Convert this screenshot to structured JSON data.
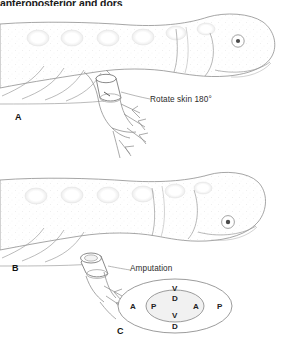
{
  "figure": {
    "header_text": "anteroposterior and dors",
    "line_color": "#8a8a8a",
    "text_color": "#2b2b2b",
    "fill_color": "#ffffff",
    "stipple_color": "#d9d9d9"
  },
  "panels": [
    {
      "id": "A",
      "label": "A",
      "annotation": "Rotate skin 180°",
      "description": "salamander larva with skin cuff rotated on hindlimb"
    },
    {
      "id": "B",
      "label": "B",
      "annotation": "Amputation",
      "description": "salamander larva with limb amputated through rotated cuff"
    },
    {
      "id": "C",
      "label": "C",
      "description": "cross-section of limb showing outer host axes and inner rotated graft axes"
    }
  ],
  "diagram_c": {
    "outer_axes": [
      {
        "position": "top",
        "code": "V"
      },
      {
        "position": "left",
        "code": "A"
      },
      {
        "position": "right",
        "code": "P"
      },
      {
        "position": "bottom",
        "code": "D"
      }
    ],
    "inner_axes": [
      {
        "position": "top",
        "code": "D"
      },
      {
        "position": "left",
        "code": "P"
      },
      {
        "position": "right",
        "code": "A"
      },
      {
        "position": "bottom",
        "code": "V"
      }
    ]
  }
}
